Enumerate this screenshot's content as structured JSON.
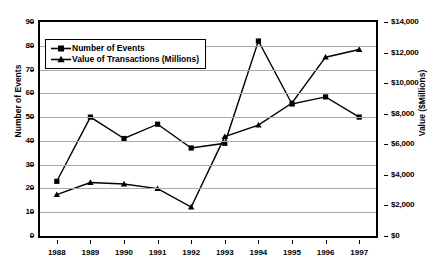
{
  "chart_data": {
    "type": "line",
    "title": "",
    "xlabel": "",
    "categories": [
      "1988",
      "1989",
      "1990",
      "1991",
      "1992",
      "1993",
      "1994",
      "1995",
      "1996",
      "1997"
    ],
    "grid": true,
    "legend_position": "upper-left-inside",
    "series": [
      {
        "name": "Number of Events",
        "marker": "square",
        "axis": "left",
        "values": [
          23,
          50,
          41,
          47,
          37,
          39,
          82,
          55.5,
          58.5,
          50
        ]
      },
      {
        "name": "Value of Transactions (Millions)",
        "marker": "triangle",
        "axis": "right",
        "values": [
          2700,
          3500,
          3400,
          3100,
          1900,
          6500,
          7250,
          8700,
          11700,
          12200
        ]
      }
    ],
    "left_axis": {
      "label": "Number of Events",
      "ylim": [
        0,
        90
      ],
      "ticks": [
        0,
        10,
        20,
        30,
        40,
        50,
        60,
        70,
        80,
        90
      ],
      "ticklabels": [
        "0",
        "10",
        "20",
        "30",
        "40",
        "50",
        "60",
        "70",
        "80",
        "90"
      ]
    },
    "right_axis": {
      "label": "Value ($Millions)",
      "ylim": [
        0,
        14000
      ],
      "ticks": [
        0,
        2000,
        4000,
        6000,
        8000,
        10000,
        12000,
        14000
      ],
      "ticklabels": [
        "$0",
        "$2,000",
        "$4,000",
        "$6,000",
        "$8,000",
        "$10,000",
        "$12,000",
        "$14,000"
      ]
    },
    "colors": {
      "line": "#000000",
      "grid": "#aaaaaa",
      "axis": "#000000",
      "background": "#ffffff"
    }
  },
  "legend": {
    "items": [
      {
        "label": "Number of Events"
      },
      {
        "label": "Value of Transactions (Millions)"
      }
    ]
  }
}
